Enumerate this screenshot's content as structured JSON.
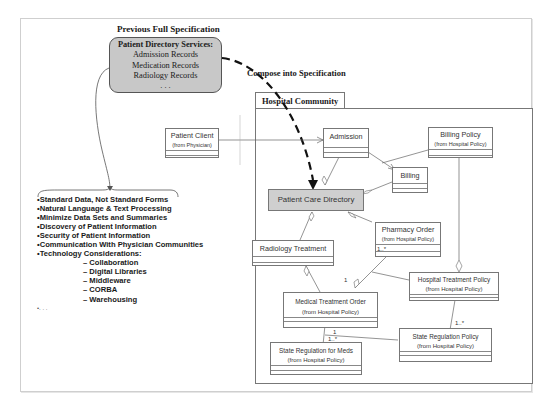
{
  "figure": {
    "previous_spec": {
      "title": "Previous Full Specification",
      "box_header": "Patient Directory Services:",
      "items": [
        "Admission Records",
        "Medication Records",
        "Radiology Records",
        ". . ."
      ]
    },
    "compose_label": "Compose into Specification",
    "bullets": [
      "•Standard Data, Not Standard Forms",
      "•Natural Language & Text Processing",
      "•Minimize Data Sets and Summaries",
      "•Discovery of Patient Information",
      "•Security of Patient Information",
      "•Communication With Physician Communities",
      "•Technology Considerations:"
    ],
    "tech_items": [
      "– Collaboration",
      "– Digital Libraries",
      "– Middleware",
      "– CORBA",
      "– Warehousing"
    ],
    "bullet_end": "•. . .",
    "package": {
      "name": "Hospital Community",
      "classes": {
        "patient_client": {
          "name": "Patient Client",
          "stereo": "(from Physician)"
        },
        "admission": {
          "name": "Admission"
        },
        "billing_policy": {
          "name": "Billing Policy",
          "stereo": "(from Hospital Policy)"
        },
        "billing": {
          "name": "Billing"
        },
        "patient_care_directory": {
          "name": "Patient Care Directory"
        },
        "pharmacy_order": {
          "name": "Pharmacy Order",
          "stereo": "(from Hospital Policy)"
        },
        "radiology_treatment": {
          "name": "Radiology Treatment"
        },
        "hospital_treatment_policy": {
          "name": "Hospital Treatment Policy",
          "stereo": "(from Hospital Policy)"
        },
        "medical_treatment_order": {
          "name": "Medical Treatment Order",
          "stereo": "(from Hospital Policy)"
        },
        "state_regulation_policy": {
          "name": "State Regulation Policy",
          "stereo": "(from Hospital Policy)"
        },
        "state_regulation_meds": {
          "name": "State Regulation for Meds",
          "stereo": "(from Hospital Policy)"
        }
      },
      "multiplicities": {
        "pharmacy_many": "1..*",
        "medical_one": "1",
        "meds_one": "1",
        "meds_many": "1..*",
        "srp_many": "1..*"
      }
    }
  }
}
